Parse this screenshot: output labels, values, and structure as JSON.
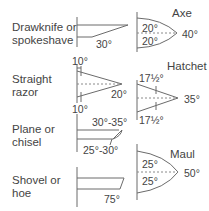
{
  "diagram": {
    "line_color": "#6b6b6b",
    "text_color": "#3a3a3a",
    "tools": [
      {
        "name_lines": [
          "Drawknife or",
          "spokeshave"
        ],
        "angles": {
          "bevel": "30°"
        }
      },
      {
        "name_lines": [
          "Straight",
          "razor"
        ],
        "angles": {
          "top": "10°",
          "bottom": "10°",
          "total": "20°"
        }
      },
      {
        "name_lines": [
          "Plane or",
          "chisel"
        ],
        "angles": {
          "secondary": "30°-35°",
          "primary": "25°-30°"
        }
      },
      {
        "name_lines": [
          "Shovel or",
          "hoe"
        ],
        "angles": {
          "bevel": "75°"
        }
      },
      {
        "name": "Axe",
        "angles": {
          "top": "20°",
          "bottom": "20°",
          "total": "40°"
        }
      },
      {
        "name": "Hatchet",
        "angles": {
          "top": "17½°",
          "bottom": "17½°",
          "total": "35°"
        }
      },
      {
        "name": "Maul",
        "angles": {
          "top": "25°",
          "bottom": "25°",
          "total": "50°"
        }
      }
    ]
  }
}
